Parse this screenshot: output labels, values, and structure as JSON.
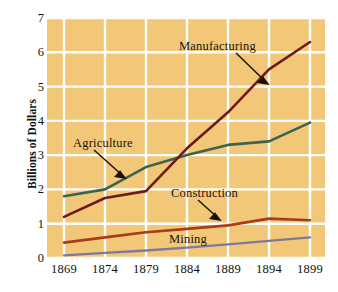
{
  "figure": {
    "background": "#ffffff",
    "plot_background": "#f2c878",
    "gridline_color": "#ffffff"
  },
  "axes": {
    "ylabel": "Billions of Dollars",
    "yticks": [
      "0",
      "1",
      "2",
      "3",
      "4",
      "5",
      "6",
      "7"
    ],
    "xticks": [
      "1869",
      "1874",
      "1879",
      "1884",
      "1889",
      "1894",
      "1899"
    ]
  },
  "annotations": [
    {
      "name": "manufacturing",
      "label": "Manufacturing"
    },
    {
      "name": "agriculture",
      "label": "Agriculture"
    },
    {
      "name": "construction",
      "label": "Construction"
    },
    {
      "name": "mining",
      "label": "Mining"
    }
  ],
  "chart_data": {
    "type": "line",
    "title": "",
    "xlabel": "",
    "ylabel": "Billions of Dollars",
    "x": [
      1869,
      1874,
      1879,
      1884,
      1889,
      1894,
      1899
    ],
    "xticklabels": [
      "1869",
      "1874",
      "1879",
      "1884",
      "1889",
      "1894",
      "1899"
    ],
    "yticks": [
      0,
      1,
      2,
      3,
      4,
      5,
      6,
      7
    ],
    "ylim": [
      0,
      7
    ],
    "xlim": [
      1869,
      1902
    ],
    "grid": true,
    "legend": "inline-annotations",
    "series": [
      {
        "name": "Manufacturing",
        "color": "#6e1a1c",
        "values": [
          1.2,
          1.75,
          1.95,
          3.2,
          4.25,
          5.5,
          6.3
        ]
      },
      {
        "name": "Agriculture",
        "color": "#3a6450",
        "values": [
          1.8,
          2.0,
          2.65,
          3.0,
          3.3,
          3.4,
          3.95
        ]
      },
      {
        "name": "Construction",
        "color": "#a83c18",
        "values": [
          0.45,
          0.6,
          0.75,
          0.85,
          0.95,
          1.15,
          1.1
        ]
      },
      {
        "name": "Mining",
        "color": "#7b7a9c",
        "values": [
          0.08,
          0.15,
          0.22,
          0.3,
          0.4,
          0.5,
          0.6
        ]
      }
    ]
  }
}
